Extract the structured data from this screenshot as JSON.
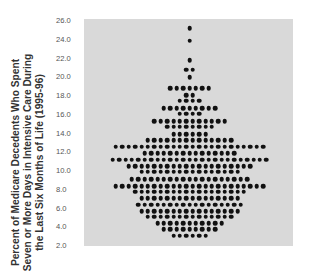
{
  "chart_data": {
    "type": "scatter",
    "subtype": "dot-plot (stacked dots, symmetric beeswarm)",
    "title": "",
    "xlabel": "",
    "ylabel": "Percent of Medicare Decedents Who Spent Seven or More Days in Intensive Care During the Last Six Months of Life (1995-96)",
    "ylim": [
      2.0,
      26.0
    ],
    "yticks": [
      "26.0",
      "24.0",
      "22.0",
      "20.0",
      "18.0",
      "16.0",
      "14.0",
      "12.0",
      "10.0",
      "8.0",
      "6.0",
      "4.0",
      "2.0"
    ],
    "grid": false,
    "legend": null,
    "background": "#d9d9d9",
    "dot_color": "#111111",
    "rows": [
      {
        "value": 25.1,
        "count": 1
      },
      {
        "value": 23.8,
        "count": 1
      },
      {
        "value": 21.7,
        "count": 1
      },
      {
        "value": 20.7,
        "count": 2
      },
      {
        "value": 19.9,
        "count": 1
      },
      {
        "value": 18.7,
        "count": 7
      },
      {
        "value": 18.0,
        "count": 2
      },
      {
        "value": 17.4,
        "count": 4
      },
      {
        "value": 16.6,
        "count": 9
      },
      {
        "value": 16.0,
        "count": 4
      },
      {
        "value": 15.2,
        "count": 12
      },
      {
        "value": 14.6,
        "count": 8
      },
      {
        "value": 13.8,
        "count": 6
      },
      {
        "value": 13.2,
        "count": 14
      },
      {
        "value": 12.5,
        "count": 24
      },
      {
        "value": 11.8,
        "count": 15
      },
      {
        "value": 11.1,
        "count": 25
      },
      {
        "value": 10.4,
        "count": 20
      },
      {
        "value": 9.8,
        "count": 16
      },
      {
        "value": 9.0,
        "count": 19
      },
      {
        "value": 8.3,
        "count": 24
      },
      {
        "value": 7.7,
        "count": 18
      },
      {
        "value": 7.0,
        "count": 16
      },
      {
        "value": 6.3,
        "count": 17
      },
      {
        "value": 5.6,
        "count": 16
      },
      {
        "value": 5.0,
        "count": 14
      },
      {
        "value": 4.3,
        "count": 11
      },
      {
        "value": 3.7,
        "count": 9
      },
      {
        "value": 3.0,
        "count": 6
      }
    ]
  }
}
